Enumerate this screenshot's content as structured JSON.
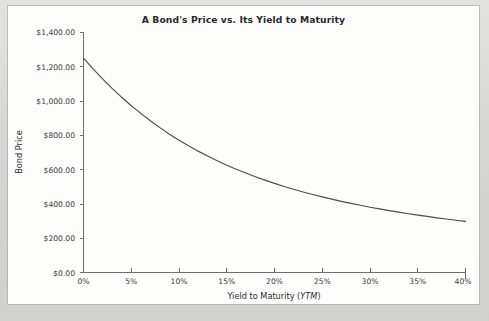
{
  "figure": {
    "title": "A Bond's Price vs. Its Yield to Maturity",
    "background_color": "#fdfdfc",
    "margin_color": "#d9d9d7",
    "line_color": "#4d4d4d",
    "axis_color": "#6f6f6f",
    "text_color": "#2a2a2a"
  },
  "chart_data": {
    "type": "line",
    "title": "A Bond's Price vs. Its Yield to Maturity",
    "subtitle": "",
    "xlabel": "Yield to Maturity (YTM)",
    "xlabel_plain": "Yield to Maturity (",
    "xlabel_italic": "YTM",
    "xlabel_close": ")",
    "ylabel": "Bond Price",
    "xlim": [
      0,
      40
    ],
    "ylim": [
      0,
      1400
    ],
    "grid": false,
    "legend": false,
    "legend_position": "none",
    "x_tick_labels": [
      "0%",
      "5%",
      "10%",
      "15%",
      "20%",
      "25%",
      "30%",
      "35%",
      "40%"
    ],
    "x_tick_values": [
      0,
      5,
      10,
      15,
      20,
      25,
      30,
      35,
      40
    ],
    "y_tick_labels": [
      "$0.00",
      "$200.00",
      "$400.00",
      "$600.00",
      "$800.00",
      "$1,000.00",
      "$1,200.00",
      "$1,400.00"
    ],
    "y_tick_values": [
      0,
      200,
      400,
      600,
      800,
      1000,
      1200,
      1400
    ],
    "series": [
      {
        "name": "Bond Price",
        "x": [
          0,
          1,
          2,
          3,
          4,
          5,
          6,
          7,
          8,
          9,
          10,
          11,
          12,
          13,
          14,
          15,
          16,
          17,
          18,
          19,
          20,
          21,
          22,
          23,
          24,
          25,
          26,
          27,
          28,
          29,
          30,
          31,
          32,
          33,
          34,
          35,
          36,
          37,
          38,
          39,
          40
        ],
        "y": [
          1250,
          1188,
          1129,
          1074,
          1022,
          973,
          928,
          885,
          845,
          807,
          772,
          739,
          708,
          679,
          652,
          626,
          602,
          580,
          559,
          539,
          520,
          502,
          486,
          470,
          455,
          441,
          428,
          415,
          403,
          392,
          381,
          371,
          361,
          352,
          343,
          335,
          327,
          319,
          312,
          305,
          298
        ]
      }
    ],
    "annotations": []
  }
}
